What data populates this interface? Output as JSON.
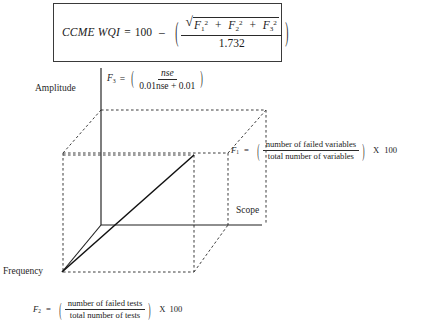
{
  "figure": {
    "main_equation": {
      "lhs": "CCME WQI",
      "equals": "=",
      "constant": "100",
      "minus": "–",
      "paren_open": "(",
      "paren_close": ")",
      "radical_sign": "√",
      "term1_var": "F",
      "term1_sub": "1",
      "term1_sup": "2",
      "plus1": "+",
      "term2_var": "F",
      "term2_sub": "2",
      "term2_sup": "2",
      "plus2": "+",
      "term3_var": "F",
      "term3_sub": "3",
      "term3_sup": "2",
      "denominator": "1.732"
    },
    "f3": {
      "var": "F",
      "sub": "3",
      "equals": "=",
      "paren_open": "(",
      "paren_close": ")",
      "numerator": "nse",
      "denominator": "0.01nse + 0.01"
    },
    "f1": {
      "var": "F",
      "sub": "1",
      "equals": "=",
      "paren_open": "(",
      "paren_close": ")",
      "numerator": "number of failed variables",
      "denominator": "total number of variables",
      "times": "X",
      "factor": "100"
    },
    "f2": {
      "var": "F",
      "sub": "2",
      "equals": "=",
      "paren_open": "(",
      "paren_close": ")",
      "numerator": "number of failed tests",
      "denominator": "total number of tests",
      "times": "X",
      "factor": "100"
    },
    "axes": {
      "amplitude": "Amplitude",
      "scope": "Scope",
      "frequency": "Frequency"
    },
    "colors": {
      "ink": "#1a1a1a",
      "rule": "#2a2a2a",
      "dashed": "#3c3c3c",
      "background": "#ffffff"
    }
  }
}
